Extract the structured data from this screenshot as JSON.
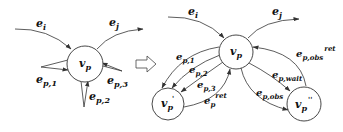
{
  "diagram": {
    "left": {
      "node": {
        "main": "v",
        "sub": "p"
      },
      "edges": [
        {
          "id": "e_i",
          "main": "e",
          "sub": "i"
        },
        {
          "id": "e_j",
          "main": "e",
          "sub": "j"
        },
        {
          "id": "e_p1",
          "main": "e",
          "sub": "p,1"
        },
        {
          "id": "e_p2",
          "main": "e",
          "sub": "p,2"
        },
        {
          "id": "e_p3",
          "main": "e",
          "sub": "p,3"
        }
      ]
    },
    "transform_arrow": "block-right-arrow",
    "right": {
      "nodes": [
        {
          "id": "vp",
          "main": "v",
          "sub": "p",
          "sup": ""
        },
        {
          "id": "vp_prime",
          "main": "v",
          "sub": "p",
          "sup": "'"
        },
        {
          "id": "vp_dprime",
          "main": "v",
          "sub": "p",
          "sup": "''"
        }
      ],
      "edges": [
        {
          "id": "e_i",
          "main": "e",
          "sub": "i",
          "sup": ""
        },
        {
          "id": "e_j",
          "main": "e",
          "sub": "j",
          "sup": ""
        },
        {
          "id": "e_p1",
          "main": "e",
          "sub": "p,1",
          "sup": ""
        },
        {
          "id": "e_p2",
          "main": "e",
          "sub": "p,2",
          "sup": ""
        },
        {
          "id": "e_p3",
          "main": "e",
          "sub": "p,3",
          "sup": ""
        },
        {
          "id": "e_p_ret",
          "main": "e",
          "sub": "p",
          "sup": "ret"
        },
        {
          "id": "e_p_wait",
          "main": "e",
          "sub": "p,wait",
          "sup": ""
        },
        {
          "id": "e_p_obs",
          "main": "e",
          "sub": "p,obs",
          "sup": ""
        },
        {
          "id": "e_p_obs_ret",
          "main": "e",
          "sub": "p,obs",
          "sup": "ret"
        }
      ]
    }
  }
}
